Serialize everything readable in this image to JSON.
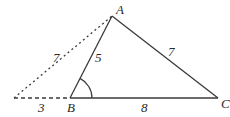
{
  "diagram": {
    "points": {
      "A": {
        "label": "A",
        "x": 112,
        "y": 16
      },
      "B": {
        "label": "B",
        "x": 70,
        "y": 98
      },
      "C": {
        "label": "C",
        "x": 218,
        "y": 98
      },
      "D": {
        "label": "",
        "x": 14,
        "y": 98
      }
    },
    "sides": {
      "AB": "5",
      "AC": "7",
      "BC": "8",
      "AD": "7",
      "DB": "3"
    },
    "colors": {
      "stroke": "#3a3a3a",
      "text": "#2a2a2a"
    }
  }
}
